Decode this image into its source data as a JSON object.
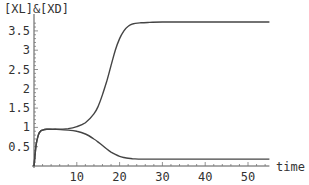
{
  "chart_data": {
    "type": "line",
    "title": "",
    "ylabel": "[XL]&[XD]",
    "xlabel": "time",
    "xlim": [
      0,
      55
    ],
    "ylim": [
      0,
      3.8
    ],
    "grid": false,
    "legend": null,
    "xticks": [
      10,
      20,
      30,
      40,
      50
    ],
    "xtick_labels": [
      "10",
      "20",
      "30",
      "40",
      "50"
    ],
    "yticks": [
      0.5,
      1,
      1.5,
      2,
      2.5,
      3,
      3.5
    ],
    "ytick_labels": [
      "0.5",
      "1",
      "1.5",
      "2",
      "2.5",
      "3",
      "3.5"
    ],
    "series": [
      {
        "name": "XL",
        "x": [
          0,
          0.5,
          1,
          1.5,
          2,
          3,
          5,
          8,
          10,
          12,
          14,
          15,
          16,
          17,
          18,
          19,
          20,
          21,
          22,
          23,
          25,
          27,
          30,
          40,
          50,
          55
        ],
        "y": [
          0,
          0.55,
          0.8,
          0.9,
          0.93,
          0.95,
          0.95,
          0.97,
          1.02,
          1.12,
          1.35,
          1.55,
          1.85,
          2.2,
          2.6,
          3.0,
          3.3,
          3.5,
          3.62,
          3.68,
          3.71,
          3.72,
          3.73,
          3.73,
          3.73,
          3.73
        ]
      },
      {
        "name": "XD",
        "x": [
          0,
          0.5,
          1,
          1.5,
          2,
          3,
          5,
          8,
          10,
          12,
          14,
          15,
          16,
          17,
          18,
          19,
          20,
          21,
          22,
          23,
          25,
          27,
          30,
          40,
          50,
          55
        ],
        "y": [
          0,
          0.55,
          0.8,
          0.9,
          0.93,
          0.95,
          0.95,
          0.93,
          0.9,
          0.83,
          0.7,
          0.62,
          0.53,
          0.44,
          0.36,
          0.3,
          0.25,
          0.22,
          0.2,
          0.19,
          0.18,
          0.18,
          0.18,
          0.18,
          0.18,
          0.18
        ]
      }
    ]
  },
  "axes": {
    "ylabel": "[XL]&[XD]",
    "xlabel": "time"
  }
}
